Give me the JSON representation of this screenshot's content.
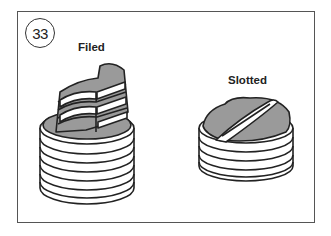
{
  "figure": {
    "number": "33",
    "panels": [
      {
        "label": "Filed",
        "illustration": "filed-plug"
      },
      {
        "label": "Slotted",
        "illustration": "slotted-plug"
      }
    ]
  },
  "colors": {
    "frame": "#555555",
    "outline": "#222222",
    "fill_gray": "#9a9a9a",
    "background": "#ffffff"
  }
}
